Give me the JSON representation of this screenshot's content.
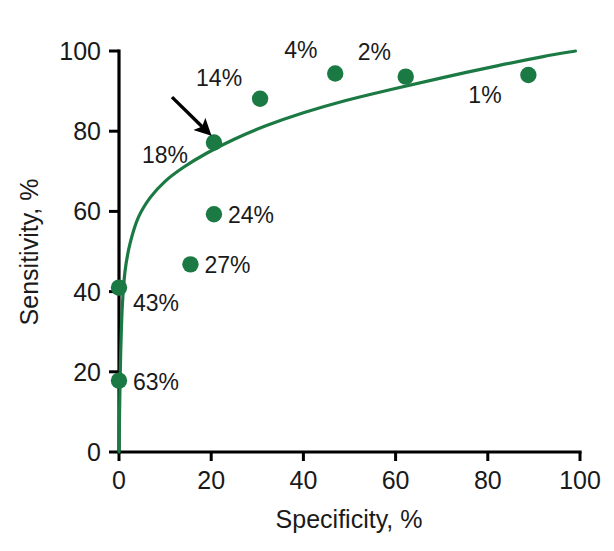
{
  "chart_data": {
    "type": "scatter",
    "title": "",
    "xlabel": "Specificity, %",
    "ylabel": "Sensitivity, %",
    "xlim": [
      0,
      100
    ],
    "ylim": [
      0,
      100
    ],
    "xticks": [
      0,
      20,
      40,
      60,
      80,
      100
    ],
    "yticks": [
      0,
      20,
      40,
      60,
      80,
      100
    ],
    "xtick_labels": [
      "0",
      "20",
      "40",
      "60",
      "80",
      "100"
    ],
    "ytick_labels": [
      "0",
      "20",
      "40",
      "60",
      "80",
      "100"
    ],
    "grid": false,
    "legend": "none",
    "series_color": "#1b7a43",
    "points": [
      {
        "label": "63%",
        "x": 0.0,
        "y": 17.8,
        "label_dx": 14,
        "label_dy": 9
      },
      {
        "label": "43%",
        "x": 0.0,
        "y": 41.0,
        "label_dx": 14,
        "label_dy": 23
      },
      {
        "label": "27%",
        "x": 15.5,
        "y": 46.8,
        "label_dx": 14,
        "label_dy": 9
      },
      {
        "label": "24%",
        "x": 20.6,
        "y": 59.3,
        "label_dx": 14,
        "label_dy": 9
      },
      {
        "label": "18%",
        "x": 20.6,
        "y": 77.2,
        "label_dx": -72,
        "label_dy": 21
      },
      {
        "label": "14%",
        "x": 30.6,
        "y": 88.1,
        "label_dx": -64,
        "label_dy": -13
      },
      {
        "label": "4%",
        "x": 46.9,
        "y": 94.4,
        "label_dx": -51,
        "label_dy": -15
      },
      {
        "label": "2%",
        "x": 62.2,
        "y": 93.6,
        "label_dx": -48,
        "label_dy": -17
      },
      {
        "label": "1%",
        "x": 88.8,
        "y": 94.0,
        "label_dx": -60,
        "label_dy": 28
      }
    ],
    "curve": [
      {
        "x": 0.0,
        "y": 0.0
      },
      {
        "x": 0.15,
        "y": 12.0
      },
      {
        "x": 0.35,
        "y": 24.0
      },
      {
        "x": 0.7,
        "y": 36.0
      },
      {
        "x": 1.3,
        "y": 45.0
      },
      {
        "x": 2.4,
        "y": 52.0
      },
      {
        "x": 4.2,
        "y": 58.5
      },
      {
        "x": 6.8,
        "y": 63.5
      },
      {
        "x": 10.0,
        "y": 67.5
      },
      {
        "x": 14.0,
        "y": 71.0
      },
      {
        "x": 19.0,
        "y": 74.5
      },
      {
        "x": 25.0,
        "y": 78.0
      },
      {
        "x": 32.0,
        "y": 81.4
      },
      {
        "x": 40.0,
        "y": 84.6
      },
      {
        "x": 49.0,
        "y": 87.6
      },
      {
        "x": 59.0,
        "y": 90.4
      },
      {
        "x": 70.0,
        "y": 93.3
      },
      {
        "x": 82.0,
        "y": 96.3
      },
      {
        "x": 92.0,
        "y": 98.6
      },
      {
        "x": 99.0,
        "y": 100.0
      }
    ],
    "annotations": [
      {
        "type": "arrow",
        "points_to_label": "18%",
        "from_x": 11.5,
        "from_y": 88.5,
        "to_x": 18.6,
        "to_y": 80.5
      }
    ]
  }
}
